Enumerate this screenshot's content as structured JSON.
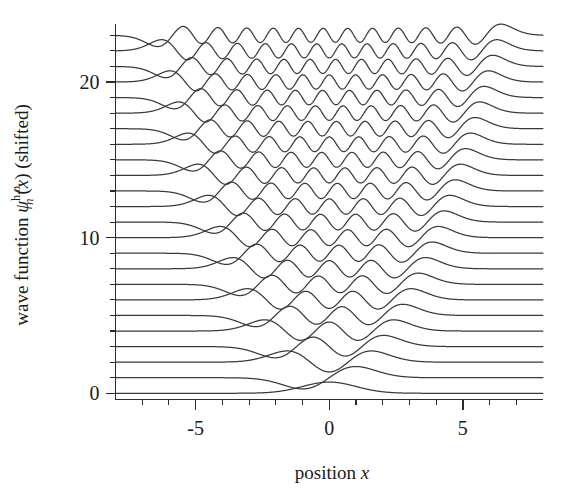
{
  "chart_data": {
    "type": "line",
    "title": "",
    "xlabel": "position x",
    "ylabel": "wave function ψₙ^{h.o.}(x) (shifted)",
    "ylabel_parts": {
      "prefix": "wave function ",
      "symbol": "ψ",
      "subscript": "n",
      "superscript": "h.o.",
      "argument": "(x)",
      "suffix": " (shifted)"
    },
    "xlabel_parts": {
      "prefix": "position ",
      "symbol": "x"
    },
    "xlim": [
      -8.0,
      8.0
    ],
    "ylim": [
      -0.4,
      23.6
    ],
    "x_ticks_major": [
      -5,
      0,
      5
    ],
    "x_ticklabels": [
      "-5",
      "0",
      "5"
    ],
    "x_ticks_minor": [
      -8,
      -7,
      -6,
      -4,
      -3,
      -2,
      -1,
      1,
      2,
      3,
      4,
      5,
      6,
      7,
      8
    ],
    "y_ticks_major": [
      0,
      10,
      20
    ],
    "y_ticklabels": [
      "0",
      "10",
      "20"
    ],
    "y_tick_minor_step": 1,
    "grid": false,
    "legend": false,
    "legend_position": "none",
    "curve_color": "#3a3a3a",
    "axis_color": "#2b2b2b",
    "background": "#ffffff",
    "n_curves": 24,
    "quantum_numbers": [
      0,
      1,
      2,
      3,
      4,
      5,
      6,
      7,
      8,
      9,
      10,
      11,
      12,
      13,
      14,
      15,
      16,
      17,
      18,
      19,
      20,
      21,
      22,
      23
    ],
    "series": [
      {
        "name": "n = 0",
        "offset": 0,
        "nodes": 0,
        "turning_point": 1.0
      },
      {
        "name": "n = 1",
        "offset": 1,
        "nodes": 1,
        "turning_point": 1.73
      },
      {
        "name": "n = 2",
        "offset": 2,
        "nodes": 2,
        "turning_point": 2.24
      },
      {
        "name": "n = 3",
        "offset": 3,
        "nodes": 3,
        "turning_point": 2.65
      },
      {
        "name": "n = 4",
        "offset": 4,
        "nodes": 4,
        "turning_point": 3.0
      },
      {
        "name": "n = 5",
        "offset": 5,
        "nodes": 5,
        "turning_point": 3.32
      },
      {
        "name": "n = 6",
        "offset": 6,
        "nodes": 6,
        "turning_point": 3.61
      },
      {
        "name": "n = 7",
        "offset": 7,
        "nodes": 7,
        "turning_point": 3.87
      },
      {
        "name": "n = 8",
        "offset": 8,
        "nodes": 8,
        "turning_point": 4.12
      },
      {
        "name": "n = 9",
        "offset": 9,
        "nodes": 9,
        "turning_point": 4.36
      },
      {
        "name": "n = 10",
        "offset": 10,
        "nodes": 10,
        "turning_point": 4.58
      },
      {
        "name": "n = 11",
        "offset": 11,
        "nodes": 11,
        "turning_point": 4.8
      },
      {
        "name": "n = 12",
        "offset": 12,
        "nodes": 12,
        "turning_point": 5.0
      },
      {
        "name": "n = 13",
        "offset": 13,
        "nodes": 13,
        "turning_point": 5.2
      },
      {
        "name": "n = 14",
        "offset": 14,
        "nodes": 14,
        "turning_point": 5.39
      },
      {
        "name": "n = 15",
        "offset": 15,
        "nodes": 15,
        "turning_point": 5.57
      },
      {
        "name": "n = 16",
        "offset": 16,
        "nodes": 16,
        "turning_point": 5.74
      },
      {
        "name": "n = 17",
        "offset": 17,
        "nodes": 17,
        "turning_point": 5.92
      },
      {
        "name": "n = 18",
        "offset": 18,
        "nodes": 18,
        "turning_point": 6.08
      },
      {
        "name": "n = 19",
        "offset": 19,
        "nodes": 19,
        "turning_point": 6.24
      },
      {
        "name": "n = 20",
        "offset": 20,
        "nodes": 20,
        "turning_point": 6.4
      },
      {
        "name": "n = 21",
        "offset": 21,
        "nodes": 21,
        "turning_point": 6.56
      },
      {
        "name": "n = 22",
        "offset": 22,
        "nodes": 22,
        "turning_point": 6.71
      },
      {
        "name": "n = 23",
        "offset": 23,
        "nodes": 23,
        "turning_point": 6.86
      }
    ],
    "amplitude_scale": 0.72
  }
}
